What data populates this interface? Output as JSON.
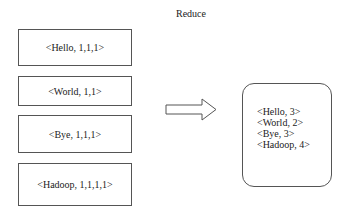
{
  "diagram": {
    "title": "Reduce",
    "inputs": [
      {
        "label": "<Hello, 1,1,1>"
      },
      {
        "label": "<World, 1,1>"
      },
      {
        "label": "<Bye, 1,1,1>"
      },
      {
        "label": "<Hadoop, 1,1,1,1>"
      }
    ],
    "arrow": "right-arrow",
    "output": {
      "lines": [
        "<Hello, 3>",
        "<World, 2>",
        "<Bye, 3>",
        "<Hadoop, 4>"
      ]
    }
  }
}
